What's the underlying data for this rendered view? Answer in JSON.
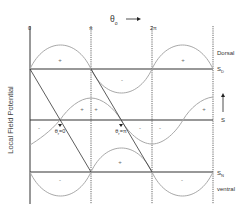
{
  "title": {
    "symbol": "θ",
    "subscript": "o",
    "arrow": "⟶"
  },
  "y_axis_label": "Local Field Potential",
  "phase_ticks": [
    "0",
    "π",
    "2π"
  ],
  "rows": [
    {
      "id": "dorsal",
      "label": "S",
      "subscript": "D",
      "region": "Dorsal"
    },
    {
      "id": "middle",
      "label": "S",
      "arrow": "↑"
    },
    {
      "id": "ventral",
      "label": "S",
      "subscript": "N",
      "region": "ventral"
    }
  ],
  "markers": [
    {
      "label": "θ",
      "subscript": "r",
      "value": "=0"
    },
    {
      "label": "θ",
      "subscript": "r",
      "value": "=π"
    }
  ],
  "signs": {
    "top": [
      "+",
      "-",
      "+"
    ],
    "middle": [
      "-",
      "+",
      "+",
      "-",
      "-",
      "+"
    ],
    "bottom": [
      "-",
      "+",
      "-"
    ]
  },
  "colors": {
    "curve": "#a8a8a8",
    "axis": "#333333",
    "dashed": "#555555"
  }
}
